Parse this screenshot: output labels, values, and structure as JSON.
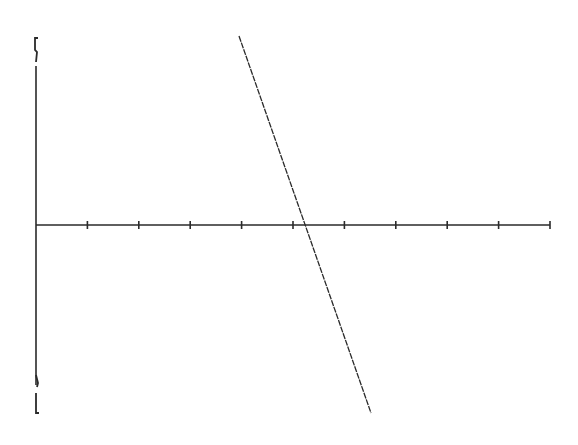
{
  "chart_data": {
    "type": "line",
    "title": "",
    "xlabel": "",
    "ylabel": "",
    "grid": false,
    "legend": null,
    "x_axis": {
      "tick_count": 10,
      "tick_labels": [],
      "range": [
        0,
        10
      ]
    },
    "y_axis": {
      "tick_labels": [],
      "range": [
        -1,
        1
      ],
      "bracket_marks": [
        "top",
        "bottom"
      ]
    },
    "series": [
      {
        "name": "line",
        "points": [
          {
            "x": 3.95,
            "y": 1.0
          },
          {
            "x": 5.25,
            "y": 0.0
          },
          {
            "x": 6.51,
            "y": -1.0
          }
        ]
      }
    ]
  },
  "layout": {
    "origin_px": [
      36,
      225
    ],
    "x_end_px": 550,
    "y_top_px": 38,
    "y_bottom_px": 415,
    "tick_spacing_px": 51.4,
    "tick_half_height_px": 4,
    "line_start_px": [
      239,
      36
    ],
    "line_end_px": [
      371,
      413
    ],
    "stroke_color": "#2a2a2a"
  }
}
